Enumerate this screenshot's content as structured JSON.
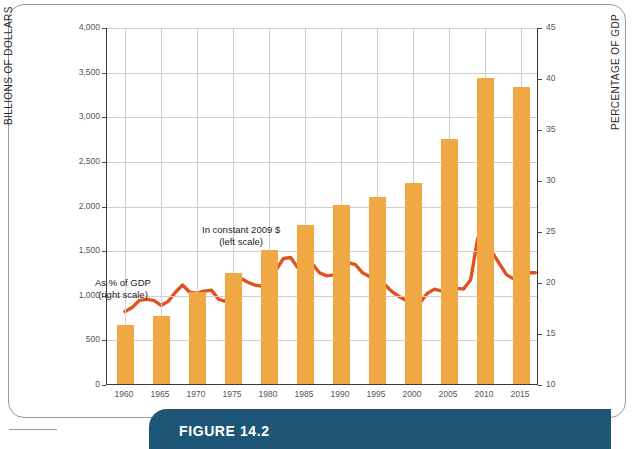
{
  "figure": {
    "caption": "FIGURE 14.2",
    "banner_color": "#1D5677"
  },
  "colors": {
    "bar": "#EFA843",
    "line": "#E0531F",
    "grid": "#CFCFCF",
    "axis": "#3A3A3A",
    "tick_text": "#555555"
  },
  "annotations": {
    "line_label_1": "As % of GDP",
    "line_label_2": "(right scale)",
    "bar_label_1": "In constant 2009 $",
    "bar_label_2": "(left scale)"
  },
  "axes": {
    "y_left_title": "BILLIONS OF DOLLARS",
    "y_right_title": "PERCENTAGE OF GDP",
    "y_left_ticks": [
      "0",
      "500",
      "1,000",
      "1,500",
      "2,000",
      "2,500",
      "3,000",
      "3,500",
      "4,000"
    ],
    "y_right_ticks": [
      "10",
      "15",
      "20",
      "25",
      "30",
      "35",
      "40",
      "45"
    ],
    "x_ticks": [
      "1960",
      "1965",
      "1970",
      "1975",
      "1980",
      "1985",
      "1990",
      "1995",
      "2000",
      "2005",
      "2010",
      "2015"
    ]
  },
  "chart_data": {
    "type": "bar",
    "title": "FIGURE 14.2",
    "xlabel": "",
    "ylabel": "BILLIONS OF DOLLARS",
    "y2label": "PERCENTAGE OF GDP",
    "ylim": [
      0,
      4000
    ],
    "y2lim": [
      10,
      45
    ],
    "grid": true,
    "legend": "inline annotations",
    "categories": [
      "1960",
      "1965",
      "1970",
      "1975",
      "1980",
      "1985",
      "1990",
      "1995",
      "2000",
      "2005",
      "2010",
      "2015"
    ],
    "series": [
      {
        "name": "In constant 2009 $ (left scale)",
        "type": "bar",
        "axis": "left",
        "units": "billions of dollars",
        "color": "#EFA843",
        "values": [
          660,
          760,
          1030,
          1240,
          1500,
          1780,
          2010,
          2090,
          2250,
          2740,
          3430,
          3330
        ]
      },
      {
        "name": "As % of GDP (right scale)",
        "type": "line",
        "axis": "right",
        "units": "percent of GDP",
        "color": "#E0531F",
        "x": [
          1960,
          1961,
          1962,
          1963,
          1964,
          1965,
          1966,
          1967,
          1968,
          1969,
          1970,
          1971,
          1972,
          1973,
          1974,
          1975,
          1976,
          1977,
          1978,
          1979,
          1980,
          1981,
          1982,
          1983,
          1984,
          1985,
          1986,
          1987,
          1988,
          1989,
          1990,
          1991,
          1992,
          1993,
          1994,
          1995,
          1996,
          1997,
          1998,
          1999,
          2000,
          2001,
          2002,
          2003,
          2004,
          2005,
          2006,
          2007,
          2008,
          2009,
          2010,
          2011,
          2012,
          2013,
          2014,
          2015,
          2016,
          2017
        ],
        "values": [
          17.2,
          17.6,
          18.3,
          18.4,
          18.3,
          17.8,
          18.2,
          19.1,
          19.8,
          19.1,
          19.0,
          19.2,
          19.3,
          18.4,
          18.2,
          20.6,
          20.5,
          20.1,
          19.8,
          19.7,
          21.1,
          21.3,
          22.4,
          22.5,
          21.5,
          22.2,
          21.9,
          21.0,
          20.7,
          20.8,
          21.4,
          22.0,
          21.8,
          21.0,
          20.6,
          20.4,
          19.9,
          19.2,
          18.7,
          18.3,
          17.7,
          18.1,
          19.0,
          19.4,
          19.2,
          19.3,
          19.5,
          19.4,
          20.3,
          24.4,
          23.6,
          23.0,
          21.9,
          20.8,
          20.4,
          20.5,
          21.0,
          21.0
        ]
      }
    ]
  }
}
